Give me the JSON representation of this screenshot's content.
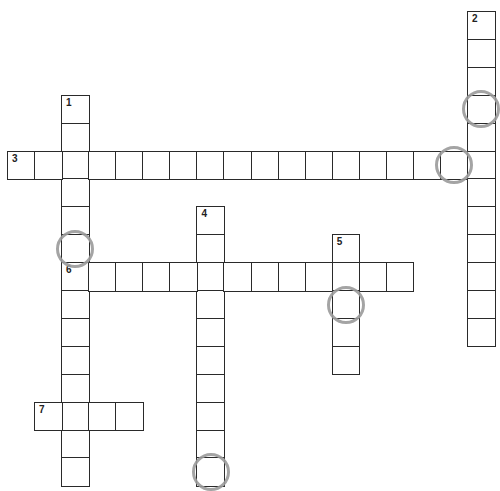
{
  "puzzle": {
    "type": "crossword",
    "words": [
      {
        "number": "1",
        "direction": "down",
        "start": {
          "col": 2,
          "row": 3
        },
        "length": 14,
        "continues_off_page": true
      },
      {
        "number": "2",
        "direction": "down",
        "start": {
          "col": 17,
          "row": 0
        },
        "length": 12
      },
      {
        "number": "3",
        "direction": "across",
        "start": {
          "col": 0,
          "row": 5
        },
        "length": 18
      },
      {
        "number": "4",
        "direction": "down",
        "start": {
          "col": 7,
          "row": 7
        },
        "length": 10,
        "continues_off_page": true
      },
      {
        "number": "5",
        "direction": "down",
        "start": {
          "col": 12,
          "row": 8
        },
        "length": 5
      },
      {
        "number": "6",
        "direction": "across",
        "start": {
          "col": 2,
          "row": 9
        },
        "length": 13
      },
      {
        "number": "7",
        "direction": "across",
        "start": {
          "col": 1,
          "row": 14
        },
        "length": 4
      }
    ],
    "circled_cells": [
      {
        "col": 17,
        "row": 3
      },
      {
        "col": 16,
        "row": 5
      },
      {
        "col": 2,
        "row": 8
      },
      {
        "col": 12,
        "row": 10
      },
      {
        "col": 7,
        "row": 16
      }
    ],
    "colors": {
      "grid_line": "#2a2a2a",
      "circle": "#9a9a9a",
      "background": "#ffffff"
    }
  }
}
